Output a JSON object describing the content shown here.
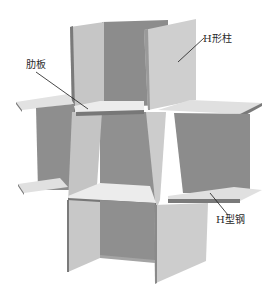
{
  "figure": {
    "labels": {
      "column": "H形柱",
      "stiffener": "肋板",
      "beam": "H型钢"
    },
    "caption": ""
  },
  "colors": {
    "background": "#ffffff",
    "light_face": "#c9c9c9",
    "mid_face": "#a8a8a8",
    "dark_face": "#8a8a8a",
    "plate_top": "#e6e6e6",
    "edge": "#6e6e6e",
    "leader_line": "#1a1a1a"
  }
}
